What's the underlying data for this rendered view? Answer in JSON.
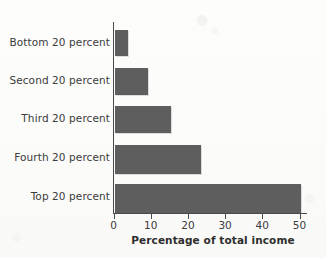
{
  "chart_data": {
    "type": "bar",
    "orientation": "horizontal",
    "title": "",
    "xlabel": "Percentage of total income",
    "ylabel": "",
    "categories": [
      "Bottom 20 percent",
      "Second 20 percent",
      "Third 20 percent",
      "Fourth 20 percent",
      "Top 20 percent"
    ],
    "values": [
      3.5,
      9,
      15,
      23,
      50
    ],
    "xlim": [
      0,
      50
    ],
    "xticks": [
      0,
      10,
      20,
      30,
      40,
      50
    ],
    "xtick_labels": [
      "0",
      "10",
      "20",
      "30",
      "40",
      "50"
    ],
    "grid": false,
    "legend": null,
    "series": [
      {
        "name": "Percentage of total income",
        "values": [
          3.5,
          9,
          15,
          23,
          50
        ]
      }
    ],
    "bar_color": "#5e5e5e",
    "axis_color": "#4a4a4a",
    "background_color": "#fdfdfc"
  }
}
